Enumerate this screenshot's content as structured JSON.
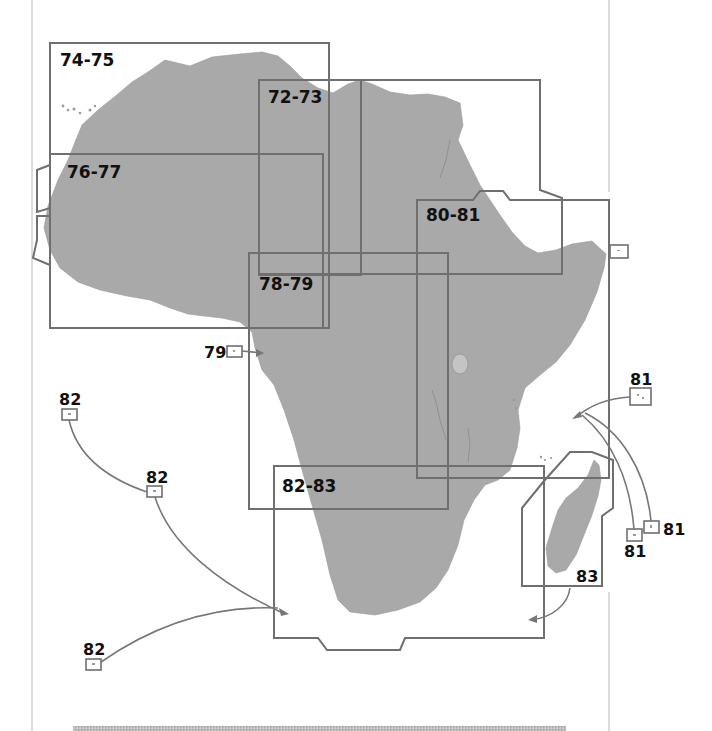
{
  "map": {
    "title": "Africa map page index",
    "land_color": "#a9a9a9",
    "frame_color": "#6f6f6f",
    "page_rule_color": "#b8b8b8"
  },
  "regions": [
    {
      "id": "74-75",
      "label": "74-75",
      "label_x": 60,
      "label_y": 66
    },
    {
      "id": "72-73",
      "label": "72-73",
      "label_x": 268,
      "label_y": 103
    },
    {
      "id": "76-77",
      "label": "76-77",
      "label_x": 67,
      "label_y": 178
    },
    {
      "id": "80-81",
      "label": "80-81",
      "label_x": 426,
      "label_y": 221
    },
    {
      "id": "78-79",
      "label": "78-79",
      "label_x": 259,
      "label_y": 290
    },
    {
      "id": "82-83",
      "label": "82-83",
      "label_x": 282,
      "label_y": 492
    }
  ],
  "insets": [
    {
      "id": "inset-79",
      "label": "79",
      "label_x": 204,
      "label_y": 358
    },
    {
      "id": "inset-82-a",
      "label": "82",
      "label_x": 59,
      "label_y": 405
    },
    {
      "id": "inset-82-b",
      "label": "82",
      "label_x": 146,
      "label_y": 483
    },
    {
      "id": "inset-82-c",
      "label": "82",
      "label_x": 83,
      "label_y": 655
    },
    {
      "id": "inset-81-a",
      "label": "81",
      "label_x": 630,
      "label_y": 385
    },
    {
      "id": "inset-81-b",
      "label": "81",
      "label_x": 663,
      "label_y": 535
    },
    {
      "id": "inset-81-c",
      "label": "81",
      "label_x": 624,
      "label_y": 557
    },
    {
      "id": "inset-83",
      "label": "83",
      "label_x": 576,
      "label_y": 582
    }
  ]
}
